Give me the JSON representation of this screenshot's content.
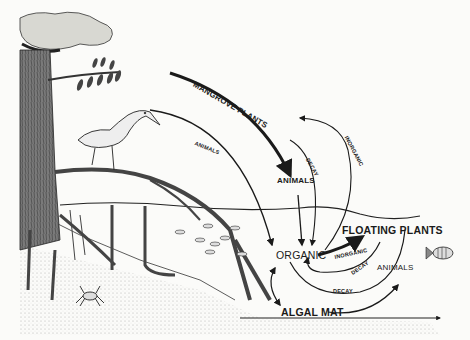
{
  "diagram": {
    "labels": {
      "mangrove_plants": "MANGROVE PLANTS",
      "animals_upper_left": "ANIMALS",
      "animals_center": "ANIMALS",
      "decay_upper": "DECAY",
      "inorganic_upper": "INORGANIC",
      "organic": "ORGANIC",
      "floating_plants": "FLOATING PLANTS",
      "inorganic_lower": "INORGANIC",
      "decay_middle": "DECAY",
      "decay_bottom": "DECAY",
      "animals_right": "ANIMALS",
      "algal_mat": "ALGAL MAT"
    },
    "nodes": [
      {
        "id": "mangrove_plants",
        "label": "MANGROVE PLANTS"
      },
      {
        "id": "animals_bird",
        "label": "ANIMALS"
      },
      {
        "id": "animals_center",
        "label": "ANIMALS"
      },
      {
        "id": "organic",
        "label": "ORGANIC"
      },
      {
        "id": "floating_plants",
        "label": "FLOATING PLANTS"
      },
      {
        "id": "animals_right",
        "label": "ANIMALS"
      },
      {
        "id": "algal_mat",
        "label": "ALGAL MAT"
      }
    ],
    "edges": [
      {
        "from": "mangrove_plants",
        "to": "organic",
        "label": ""
      },
      {
        "from": "animals_bird",
        "to": "organic",
        "label": "ANIMALS"
      },
      {
        "from": "animals_center",
        "to": "organic",
        "label": "DECAY"
      },
      {
        "from": "organic",
        "to": "mangrove_plants",
        "label": "INORGANIC"
      },
      {
        "from": "organic",
        "to": "floating_plants",
        "label": "INORGANIC"
      },
      {
        "from": "floating_plants",
        "to": "organic",
        "label": "DECAY"
      },
      {
        "from": "organic",
        "to": "animals_right",
        "label": "DECAY"
      },
      {
        "from": "algal_mat",
        "to": "animals_right",
        "label": ""
      },
      {
        "from": "organic",
        "to": "algal_mat",
        "label": ""
      }
    ],
    "illustrations": [
      "mangrove-tree",
      "heron",
      "fish-school",
      "fish",
      "crab",
      "roots",
      "water-line",
      "sediment"
    ]
  }
}
